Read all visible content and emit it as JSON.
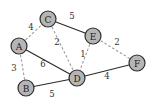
{
  "diagram": {
    "type": "weighted-graph",
    "colors": {
      "node_fill": "#b5b5b5",
      "node_stroke": "#2e2e2e",
      "solid_edge": "#2a2a2a",
      "dashed_edge": "#9a9a9a"
    },
    "nodes": [
      {
        "id": "A",
        "label": "A",
        "x": 19,
        "y": 46
      },
      {
        "id": "B",
        "label": "B",
        "x": 26,
        "y": 88
      },
      {
        "id": "C",
        "label": "C",
        "x": 48,
        "y": 19
      },
      {
        "id": "D",
        "label": "D",
        "x": 77,
        "y": 78
      },
      {
        "id": "E",
        "label": "E",
        "x": 93,
        "y": 36
      },
      {
        "id": "F",
        "label": "F",
        "x": 137,
        "y": 63
      }
    ],
    "edges": [
      {
        "from": "A",
        "to": "C",
        "weight": "4",
        "style": "dashed",
        "label_x": 31,
        "label_y": 27
      },
      {
        "from": "C",
        "to": "E",
        "weight": "5",
        "style": "solid",
        "label_x": 72,
        "label_y": 16
      },
      {
        "from": "C",
        "to": "D",
        "weight": "2",
        "style": "dashed",
        "label_x": 57,
        "label_y": 42
      },
      {
        "from": "A",
        "to": "D",
        "weight": "6",
        "style": "solid",
        "label_x": 43,
        "label_y": 64
      },
      {
        "from": "A",
        "to": "B",
        "weight": "3",
        "style": "dashed",
        "label_x": 14,
        "label_y": 68
      },
      {
        "from": "B",
        "to": "D",
        "weight": "5",
        "style": "solid",
        "label_x": 52,
        "label_y": 94
      },
      {
        "from": "E",
        "to": "D",
        "weight": "1",
        "style": "dashed",
        "label_x": 83,
        "label_y": 54
      },
      {
        "from": "E",
        "to": "F",
        "weight": "2",
        "style": "dashed",
        "label_x": 117,
        "label_y": 42
      },
      {
        "from": "D",
        "to": "F",
        "weight": "4",
        "style": "solid",
        "label_x": 107,
        "label_y": 76
      }
    ]
  }
}
